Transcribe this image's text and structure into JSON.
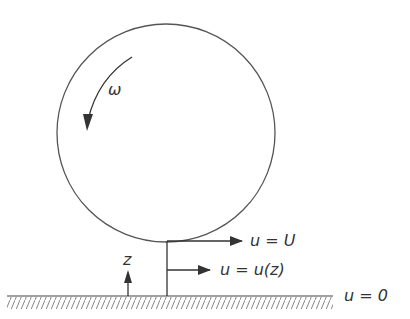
{
  "diagram": {
    "type": "couette-flow-rolling-cylinder",
    "rotation_label": "ω",
    "velocity_top_label": "u = U",
    "velocity_profile_label": "u = u(z)",
    "ground_label": "u = 0",
    "axis_label": "z"
  },
  "colors": {
    "stroke": "#444444",
    "text": "#333333",
    "background": "#ffffff"
  }
}
